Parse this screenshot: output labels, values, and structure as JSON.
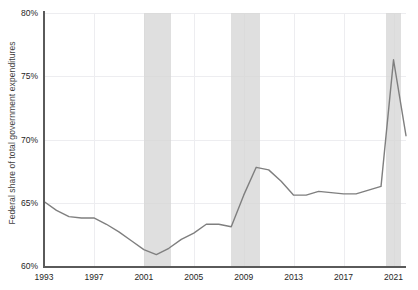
{
  "chart_data": {
    "type": "line",
    "title": "",
    "xlabel": "",
    "ylabel": "Federal share of total government expenditures",
    "xlim": [
      1993,
      2022
    ],
    "ylim": [
      60,
      80
    ],
    "ytick_labels": [
      "60%",
      "65%",
      "70%",
      "75%",
      "80%"
    ],
    "ytick_values": [
      60,
      65,
      70,
      75,
      80
    ],
    "xtick_labels": [
      "1993",
      "1997",
      "2001",
      "2005",
      "2009",
      "2013",
      "2017",
      "2021"
    ],
    "xtick_values": [
      1993,
      1997,
      2001,
      2005,
      2009,
      2013,
      2017,
      2021
    ],
    "grid": true,
    "legend": "none",
    "series": [
      {
        "name": "Federal share of total government expenditures",
        "color": "#7f7f7f",
        "x": [
          1993,
          1994,
          1995,
          1996,
          1997,
          1998,
          1999,
          2000,
          2001,
          2002,
          2003,
          2004,
          2005,
          2006,
          2007,
          2008,
          2009,
          2010,
          2011,
          2012,
          2013,
          2014,
          2015,
          2016,
          2017,
          2018,
          2019,
          2020,
          2021,
          2022
        ],
        "values": [
          65.1,
          64.4,
          63.9,
          63.8,
          63.8,
          63.3,
          62.7,
          62.0,
          61.3,
          60.9,
          61.4,
          62.1,
          62.6,
          63.3,
          63.3,
          63.1,
          65.6,
          67.8,
          67.6,
          66.7,
          65.6,
          65.6,
          65.9,
          65.8,
          65.7,
          65.7,
          66.0,
          66.3,
          76.3,
          70.3
        ]
      }
    ],
    "shaded_regions": [
      {
        "label": "recession-2001",
        "start": 2001.0,
        "end": 2003.2
      },
      {
        "label": "recession-2008",
        "start": 2008.0,
        "end": 2010.3
      },
      {
        "label": "recession-2020",
        "start": 2020.4,
        "end": 2021.6
      }
    ]
  }
}
